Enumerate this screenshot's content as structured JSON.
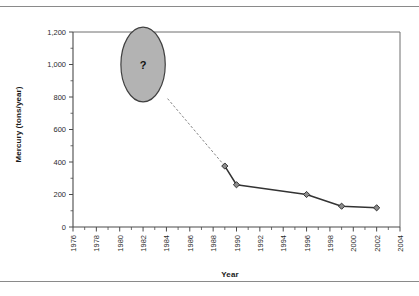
{
  "figure": {
    "has_top_rule": true,
    "has_bottom_rule": true
  },
  "chart_data": {
    "type": "line",
    "title": "",
    "xlabel": "Year",
    "ylabel": "Mercury (tons/year)",
    "xlim": [
      1976,
      2004
    ],
    "ylim": [
      0,
      1200
    ],
    "grid": false,
    "legend": null,
    "xticks": [
      "1976",
      "1978",
      "1980",
      "1982",
      "1984",
      "1986",
      "1988",
      "1990",
      "1992",
      "1994",
      "1996",
      "1998",
      "2000",
      "2002",
      "2004"
    ],
    "xtick_values": [
      1976,
      1978,
      1980,
      1982,
      1984,
      1986,
      1988,
      1990,
      1992,
      1994,
      1996,
      1998,
      2000,
      2002,
      2004
    ],
    "xtick_minor_step": 1,
    "yticks": [
      "0",
      "200",
      "400",
      "600",
      "800",
      "1,000",
      "1,200"
    ],
    "ytick_values": [
      0,
      200,
      400,
      600,
      800,
      1000,
      1200
    ],
    "series": [
      {
        "name": "Mercury emissions",
        "marker": "diamond",
        "x": [
          1989,
          1990,
          1996,
          1999,
          2002
        ],
        "values": [
          375,
          260,
          200,
          128,
          118
        ]
      }
    ],
    "annotations": [
      {
        "type": "bubble",
        "label": "?",
        "x": 1982,
        "y": 1000,
        "radius_x_years": 1.9,
        "radius_y_units": 230,
        "fill": "#b3b3b3",
        "stroke": "#404040",
        "note": "unknown historical emissions"
      },
      {
        "type": "dashed-connector",
        "from_x": 1984.1,
        "from_y": 790,
        "to_x": 1989,
        "to_y": 375
      }
    ],
    "colors": {
      "line": "#333333",
      "marker_fill": "#8c8c8c",
      "marker_stroke": "#333333",
      "axis": "#4a4a4a",
      "bubble_fill": "#b3b3b3",
      "bubble_stroke": "#404040",
      "text": "#1a1a1a"
    }
  }
}
